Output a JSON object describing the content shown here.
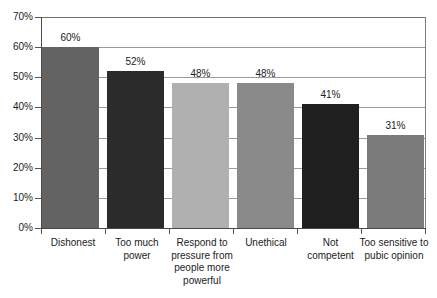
{
  "chart_data": {
    "type": "bar",
    "title": "",
    "subtitle": "",
    "xlabel": "",
    "ylabel": "",
    "ylim": [
      0,
      70
    ],
    "ytick_labels": [
      "0%",
      "10%",
      "20%",
      "30%",
      "40%",
      "50%",
      "60%",
      "70%"
    ],
    "ytick_values": [
      0,
      10,
      20,
      30,
      40,
      50,
      60,
      70
    ],
    "grid": true,
    "legend": false,
    "categories": [
      "Dishonest",
      "Too much power",
      "Respond to pressure from people more powerful",
      "Unethical",
      "Not competent",
      "Too sensitive to pubic opinion"
    ],
    "values": [
      60,
      52,
      48,
      48,
      41,
      31
    ],
    "data_labels": [
      "60%",
      "52%",
      "48%",
      "48%",
      "41%",
      "31%"
    ],
    "bar_colors": [
      "#636363",
      "#2b2b2b",
      "#b0b0b0",
      "#8a8a8a",
      "#1f1f1f",
      "#7a7a7a"
    ]
  },
  "colors": {
    "background": "#ffffff",
    "axis": "#4a4a4a",
    "gridline": "#9a9a9a",
    "text": "#1c1c1c"
  }
}
